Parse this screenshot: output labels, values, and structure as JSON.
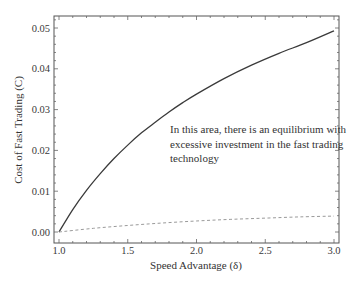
{
  "chart_data": {
    "type": "line",
    "title": "",
    "xlabel": "Speed Advantage (δ)",
    "ylabel": "Cost of Fast Trading (C)",
    "xlim": [
      1.0,
      3.0
    ],
    "ylim": [
      -0.0027,
      0.0528
    ],
    "x_ticks": [
      "1.0",
      "1.5",
      "2.0",
      "2.5",
      "3.0"
    ],
    "y_ticks": [
      "0.00",
      "0.01",
      "0.02",
      "0.03",
      "0.04",
      "0.05"
    ],
    "grid": false,
    "legend": null,
    "annotations": [
      {
        "text_lines": [
          "In this area, there is an equilibrium with",
          "excessive investment in the fast trading",
          "technology"
        ],
        "x": 1.81,
        "y": 0.0249
      }
    ],
    "series": [
      {
        "name": "upper threshold (solid)",
        "style": "solid",
        "color": "#3a3a3a",
        "x": [
          1.0,
          1.1,
          1.2,
          1.3,
          1.4,
          1.5,
          1.6,
          1.7,
          1.8,
          1.9,
          2.0,
          2.2,
          2.4,
          2.6,
          2.8,
          3.0
        ],
        "values": [
          0.0,
          0.0055,
          0.0102,
          0.0143,
          0.018,
          0.0213,
          0.0243,
          0.0269,
          0.0294,
          0.0317,
          0.0338,
          0.0376,
          0.0409,
          0.0438,
          0.0464,
          0.0493
        ]
      },
      {
        "name": "lower threshold (dashed)",
        "style": "dashed",
        "color": "#9a9a9a",
        "x": [
          1.0,
          1.25,
          1.5,
          1.75,
          2.0,
          2.25,
          2.5,
          2.75,
          3.0
        ],
        "values": [
          0.0,
          0.0009,
          0.0016,
          0.0022,
          0.0027,
          0.0031,
          0.0034,
          0.0037,
          0.0039
        ]
      }
    ]
  }
}
